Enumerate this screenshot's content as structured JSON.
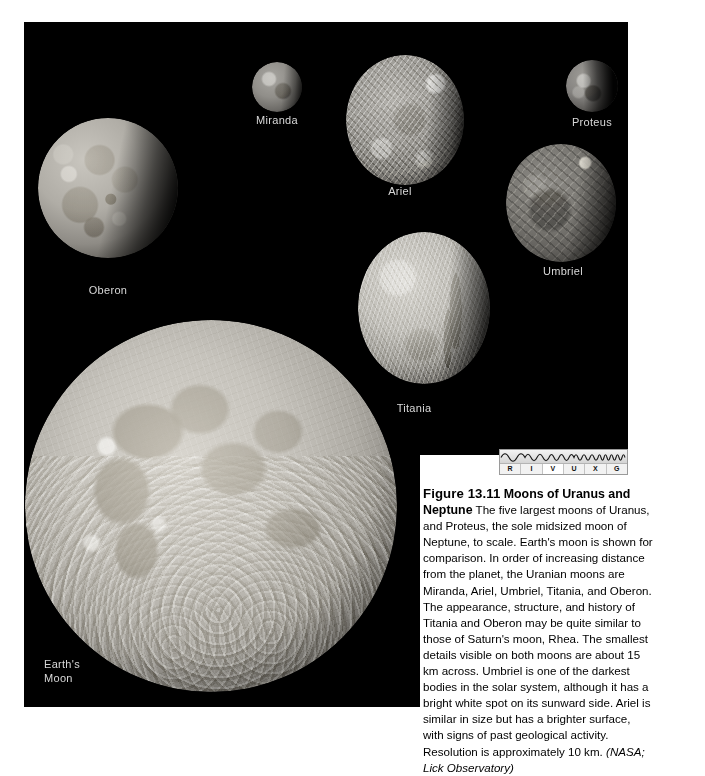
{
  "figure": {
    "number": "Figure 13.11",
    "title": "Moons of Uranus and Neptune",
    "body": "The five largest moons of Uranus, and Proteus, the sole midsized moon of Neptune, to scale. Earth's moon is shown for comparison. In order of increasing distance from the planet, the Uranian moons are Miranda, Ariel, Umbriel, Titania, and Oberon. The appearance, structure, and history of Titania and Oberon may be quite similar to those of Saturn's moon, Rhea. The smallest details visible on both moons are about 15 km across. Umbriel is one of the darkest bodies in the solar system, although it has a bright white spot on its sunward side. Ariel is similar in size but has a brighter surface, with signs of past geological activity. Resolution is approximately 10 km. ",
    "credit": "(NASA; Lick Observatory)"
  },
  "spectrum_bar": {
    "name": "RIVUXG wavelength indicator",
    "bands": [
      {
        "letter": "R",
        "label": "Radio",
        "active": false
      },
      {
        "letter": "I",
        "label": "Infrared",
        "active": false
      },
      {
        "letter": "V",
        "label": "Visible",
        "active": true
      },
      {
        "letter": "U",
        "label": "Ultraviolet",
        "active": false
      },
      {
        "letter": "X",
        "label": "X-ray",
        "active": false
      },
      {
        "letter": "G",
        "label": "Gamma ray",
        "active": false
      }
    ]
  },
  "plate": {
    "background_color": "#000000",
    "label_color": "#d8d8d8"
  },
  "moons": [
    {
      "id": "miranda",
      "label": "Miranda",
      "body": "Uranus",
      "diameter_px": 50,
      "brightness": "medium-gray, heavily grooved (coronae)"
    },
    {
      "id": "ariel",
      "label": "Ariel",
      "body": "Uranus",
      "diameter_px": 120,
      "brightness": "bright, fractured canyon terrain"
    },
    {
      "id": "proteus",
      "label": "Proteus",
      "body": "Neptune",
      "diameter_px": 50,
      "brightness": "dark, crescent-lit irregular body"
    },
    {
      "id": "oberon",
      "label": "Oberon",
      "body": "Uranus",
      "diameter_px": 140,
      "brightness": "light gray, dark crater floors"
    },
    {
      "id": "umbriel",
      "label": "Umbriel",
      "body": "Uranus",
      "diameter_px": 110,
      "brightness": "darkest of the Uranian moons, bright spot on sunward side"
    },
    {
      "id": "titania",
      "label": "Titania",
      "body": "Uranus",
      "diameter_px": 132,
      "brightness": "bright, with long fault canyons"
    },
    {
      "id": "earths-moon",
      "label": "Earth's\nMoon",
      "body": "Earth",
      "diameter_px": 372,
      "brightness": "bright highlands with dark maria"
    }
  ]
}
